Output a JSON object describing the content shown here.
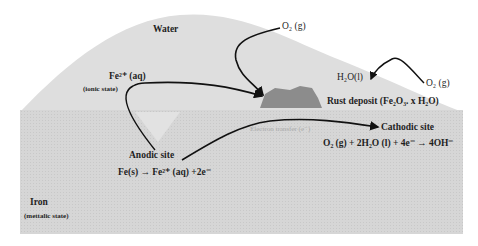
{
  "diagram": {
    "colors": {
      "water": "#dcdcdc",
      "iron": "#d2d2d2",
      "rust": "#8c8c8c",
      "arrows": "#111111",
      "pit": "#e4e4e4"
    },
    "labels": {
      "water": "Water",
      "o2_top": "O₂ (g)",
      "o2_right": "O₂ (g)",
      "h2o": "H₂O(l)",
      "fe2": "Fe²⁺ (aq)",
      "ionic_state": "(ionic state)",
      "rust": "Rust deposit (Fe₂O₃. x H₂O)",
      "electron_transfer": "Electron transfer (e⁻)",
      "cathodic_site": "Cathodic site",
      "cathode_equation": "O₂ (g) + 2H₂O (l) + 4e⁻ → 4OH⁻",
      "anodic_site": "Anodic site",
      "anode_equation": "Fe(s) → Fe²⁺ (aq) +2e⁻",
      "iron": "Iron",
      "metallic_state": "(mettalic state)"
    }
  }
}
